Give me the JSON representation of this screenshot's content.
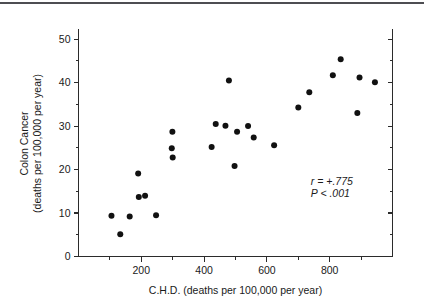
{
  "figure": {
    "top_rule_color": "#4d4d52",
    "background": "#ffffff",
    "point_color": "#111111"
  },
  "chart_data": {
    "type": "scatter",
    "title": "",
    "xlabel": "C.H.D. (deaths per 100,000 per year)",
    "ylabel_line1": "Colon Cancer",
    "ylabel_line2": "(deaths per 100,000 per year)",
    "xlim": [
      0,
      1000
    ],
    "ylim": [
      0,
      52
    ],
    "grid": false,
    "legend": null,
    "x_ticks_major": [
      200,
      400,
      600,
      800
    ],
    "x_tick_labels": [
      "200",
      "400",
      "600",
      "800"
    ],
    "x_ticks_minor": [
      100,
      300,
      500,
      700,
      900
    ],
    "y_ticks_major": [
      0,
      10,
      20,
      30,
      40,
      50
    ],
    "y_tick_labels": [
      "0",
      "10",
      "20",
      "30",
      "40",
      "50"
    ],
    "y_ticks_minor": [
      5,
      15,
      25,
      35,
      45
    ],
    "points": [
      {
        "x": 105,
        "y": 9.4
      },
      {
        "x": 133,
        "y": 5.1
      },
      {
        "x": 163,
        "y": 9.2
      },
      {
        "x": 190,
        "y": 19.1
      },
      {
        "x": 192,
        "y": 13.7
      },
      {
        "x": 212,
        "y": 14.0
      },
      {
        "x": 247,
        "y": 9.5
      },
      {
        "x": 297,
        "y": 24.9
      },
      {
        "x": 299,
        "y": 28.7
      },
      {
        "x": 300,
        "y": 22.8
      },
      {
        "x": 424,
        "y": 25.2
      },
      {
        "x": 437,
        "y": 30.5
      },
      {
        "x": 468,
        "y": 30.1
      },
      {
        "x": 479,
        "y": 40.5
      },
      {
        "x": 497,
        "y": 20.8
      },
      {
        "x": 505,
        "y": 28.7
      },
      {
        "x": 540,
        "y": 30.0
      },
      {
        "x": 558,
        "y": 27.4
      },
      {
        "x": 623,
        "y": 25.6
      },
      {
        "x": 700,
        "y": 34.3
      },
      {
        "x": 735,
        "y": 37.8
      },
      {
        "x": 810,
        "y": 41.7
      },
      {
        "x": 835,
        "y": 45.4
      },
      {
        "x": 888,
        "y": 33.0
      },
      {
        "x": 895,
        "y": 41.2
      },
      {
        "x": 944,
        "y": 40.1
      }
    ],
    "annotations": [
      {
        "text": "r = +.775",
        "x": 740,
        "y": 16.5
      },
      {
        "text": "P < .001",
        "x": 740,
        "y": 13.6
      }
    ]
  }
}
